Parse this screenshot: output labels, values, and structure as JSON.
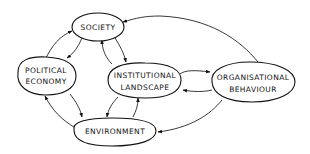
{
  "diagram": {
    "nodes": [
      {
        "id": "society",
        "lines": [
          "SOCIETY"
        ]
      },
      {
        "id": "political_economy",
        "lines": [
          "POLITICAL",
          "ECONOMY"
        ]
      },
      {
        "id": "institutional_landscape",
        "lines": [
          "INSTITUTIONAL",
          "LANDSCAPE"
        ]
      },
      {
        "id": "organisational_behaviour",
        "lines": [
          "ORGANISATIONAL",
          "BEHAVIOUR"
        ]
      },
      {
        "id": "environment",
        "lines": [
          "ENVIRONMENT"
        ]
      }
    ],
    "edges": [
      {
        "from": "political_economy",
        "to": "society"
      },
      {
        "from": "society",
        "to": "political_economy"
      },
      {
        "from": "society",
        "to": "institutional_landscape"
      },
      {
        "from": "institutional_landscape",
        "to": "society"
      },
      {
        "from": "organisational_behaviour",
        "to": "society"
      },
      {
        "from": "institutional_landscape",
        "to": "organisational_behaviour"
      },
      {
        "from": "organisational_behaviour",
        "to": "institutional_landscape"
      },
      {
        "from": "political_economy",
        "to": "environment"
      },
      {
        "from": "environment",
        "to": "political_economy"
      },
      {
        "from": "institutional_landscape",
        "to": "environment"
      },
      {
        "from": "environment",
        "to": "institutional_landscape"
      },
      {
        "from": "organisational_behaviour",
        "to": "environment"
      }
    ],
    "style": {
      "stroke": "#111111",
      "background": "#ffffff"
    }
  }
}
